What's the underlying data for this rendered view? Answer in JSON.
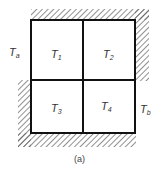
{
  "figure": {
    "caption": "(a)",
    "cells": [
      {
        "id": "T1",
        "symbol": "T",
        "subscript": "1"
      },
      {
        "id": "T2",
        "symbol": "T",
        "subscript": "2"
      },
      {
        "id": "T3",
        "symbol": "T",
        "subscript": "3"
      },
      {
        "id": "T4",
        "symbol": "T",
        "subscript": "4"
      }
    ],
    "boundaries": {
      "left": {
        "symbol": "T",
        "subscript": "a"
      },
      "right": {
        "symbol": "T",
        "subscript": "b"
      },
      "insulated_sides": [
        "top",
        "right-upper",
        "left-lower",
        "bottom"
      ]
    },
    "colors": {
      "line": "#111111",
      "hatch": "#555555",
      "text": "#333333"
    }
  }
}
